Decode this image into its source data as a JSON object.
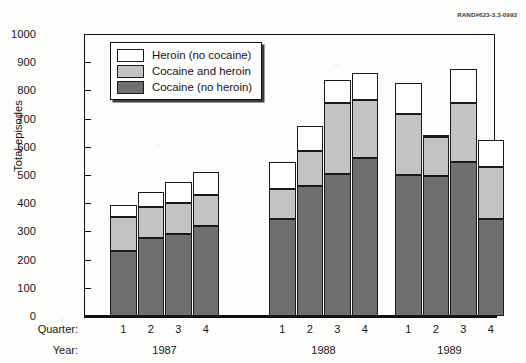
{
  "figure": {
    "rand_code": "RAND#623-3.3-0993",
    "y_axis_title": "Total episodes",
    "quarter_row_title": "Quarter:",
    "year_row_title": "Year:"
  },
  "legend": {
    "position": "inside-top-left",
    "items": [
      {
        "label": "Heroin (no cocaine)",
        "color": "#ffffff",
        "key": "heroin_no_cocaine"
      },
      {
        "label": "Cocaine and heroin",
        "color": "#c3c3c3",
        "key": "cocaine_and_heroin"
      },
      {
        "label": "Cocaine (no heroin)",
        "color": "#6f6f6f",
        "key": "cocaine_no_heroin"
      }
    ]
  },
  "axis": {
    "y_ticks": [
      0,
      100,
      200,
      300,
      400,
      500,
      600,
      700,
      800,
      900,
      1000
    ],
    "y_tick_labels": [
      "0",
      "100",
      "200",
      "300",
      "400",
      "500",
      "600",
      "700",
      "800",
      "900",
      "1000"
    ],
    "quarter_labels": [
      "1",
      "2",
      "3",
      "4"
    ],
    "year_labels": [
      "1987",
      "1988",
      "1989"
    ]
  },
  "chart_data": {
    "type": "bar",
    "stacked": true,
    "title": "",
    "subtitle": "",
    "xlabel": "Quarter / Year",
    "ylabel": "Total episodes",
    "ylim": [
      0,
      1000
    ],
    "grid": false,
    "legend_position": "inside top-left",
    "categories": [
      "1987 Q1",
      "1987 Q2",
      "1987 Q3",
      "1987 Q4",
      "1988 Q1",
      "1988 Q2",
      "1988 Q3",
      "1988 Q4",
      "1989 Q1",
      "1989 Q2",
      "1989 Q3",
      "1989 Q4"
    ],
    "series": [
      {
        "name": "Cocaine (no heroin)",
        "color": "#6f6f6f",
        "values": [
          230,
          275,
          290,
          320,
          345,
          460,
          505,
          560,
          500,
          495,
          545,
          345
        ]
      },
      {
        "name": "Cocaine and heroin",
        "color": "#c3c3c3",
        "values": [
          120,
          110,
          110,
          110,
          105,
          125,
          250,
          205,
          215,
          140,
          210,
          185
        ]
      },
      {
        "name": "Heroin (no cocaine)",
        "color": "#ffffff",
        "values": [
          45,
          55,
          75,
          80,
          95,
          90,
          83,
          97,
          113,
          5,
          120,
          95
        ]
      }
    ],
    "cumulative_tops": {
      "cocaine_no_heroin": [
        230,
        275,
        290,
        320,
        345,
        460,
        505,
        560,
        500,
        495,
        545,
        345
      ],
      "cocaine_and_heroin": [
        350,
        385,
        400,
        430,
        450,
        585,
        755,
        765,
        715,
        635,
        755,
        530
      ],
      "totals": [
        395,
        440,
        475,
        510,
        545,
        675,
        838,
        862,
        828,
        640,
        875,
        625
      ]
    }
  }
}
